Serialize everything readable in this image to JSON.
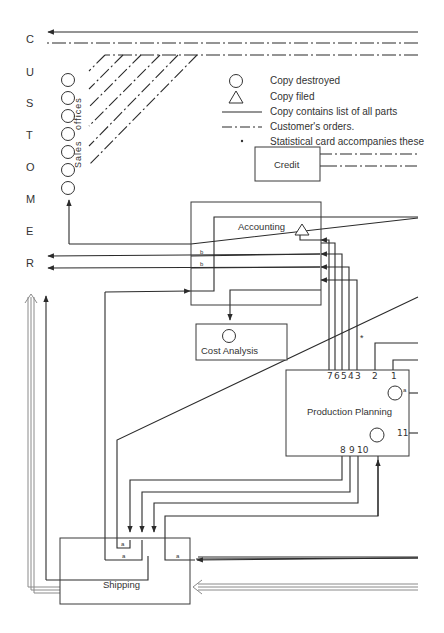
{
  "customer_letters": [
    "C",
    "U",
    "S",
    "T",
    "O",
    "M",
    "E",
    "R"
  ],
  "sales_offices": {
    "label_1": "Sales",
    "label_2": "offices",
    "circle_count": 7
  },
  "legend": {
    "items": [
      {
        "symbol": "circle",
        "text": "Copy destroyed"
      },
      {
        "symbol": "triangle",
        "text": "Copy filed"
      },
      {
        "symbol": "solid-line",
        "text": "Copy contains list of all parts"
      },
      {
        "symbol": "dash-dot-line",
        "text": "Customer's orders."
      },
      {
        "symbol": "asterisk",
        "text": "Statistical card accompanies these"
      }
    ]
  },
  "departments": {
    "credit": "Credit",
    "accounting": "Accounting",
    "cost_analysis": "Cost Analysis",
    "production_planning": "Production Planning",
    "shipping": "Shipping"
  },
  "line_marks": {
    "b1": "b",
    "b2": "b",
    "a_pp": "a",
    "a_ship_1": "a",
    "a_ship_2": "a",
    "a_ship_3": "a",
    "asterisk": "*"
  },
  "pp_top_numbers": [
    "7",
    "6",
    "5",
    "4",
    "3",
    "2",
    "1"
  ],
  "pp_bottom_numbers": [
    "8",
    "9",
    "10"
  ],
  "pp_right_number": "11",
  "colors": {
    "line": "#2b2b2b",
    "double_line": "#8a8a8a",
    "box": "#3a3a3a"
  }
}
